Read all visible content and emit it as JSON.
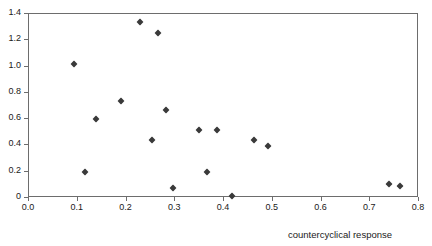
{
  "chart_data": {
    "type": "scatter",
    "title": "",
    "xlabel": "countercyclical response",
    "ylabel": "",
    "xlim": [
      0.0,
      0.8
    ],
    "ylim": [
      0.0,
      1.4
    ],
    "grid": false,
    "legend": null,
    "marker": "diamond",
    "marker_color": "#3a3a3a",
    "frame_color": "#6d6d6d",
    "xticks": [
      "0.0",
      "0.1",
      "0.2",
      "0.3",
      "0.4",
      "0.5",
      "0.6",
      "0.7",
      "0.8"
    ],
    "xtick_values": [
      0.0,
      0.1,
      0.2,
      0.3,
      0.4,
      0.5,
      0.6,
      0.7,
      0.8
    ],
    "yticks": [
      "0",
      "0.2",
      "0.4",
      "0.6",
      "0.8",
      "1.0",
      "1.2",
      "1.4"
    ],
    "ytick_values": [
      0.0,
      0.2,
      0.4,
      0.6,
      0.8,
      1.0,
      1.2,
      1.4
    ],
    "points": [
      {
        "x": 0.094,
        "y": 1.01
      },
      {
        "x": 0.117,
        "y": 0.19
      },
      {
        "x": 0.139,
        "y": 0.59
      },
      {
        "x": 0.191,
        "y": 0.73
      },
      {
        "x": 0.23,
        "y": 1.33
      },
      {
        "x": 0.254,
        "y": 0.43
      },
      {
        "x": 0.267,
        "y": 1.25
      },
      {
        "x": 0.283,
        "y": 0.66
      },
      {
        "x": 0.297,
        "y": 0.07
      },
      {
        "x": 0.351,
        "y": 0.51
      },
      {
        "x": 0.367,
        "y": 0.19
      },
      {
        "x": 0.388,
        "y": 0.51
      },
      {
        "x": 0.418,
        "y": 0.01
      },
      {
        "x": 0.463,
        "y": 0.43
      },
      {
        "x": 0.492,
        "y": 0.39
      },
      {
        "x": 0.74,
        "y": 0.1
      },
      {
        "x": 0.763,
        "y": 0.08
      }
    ]
  }
}
